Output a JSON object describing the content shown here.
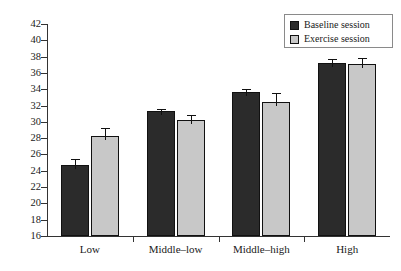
{
  "chart_data": {
    "type": "bar",
    "title": "",
    "xlabel": "",
    "ylabel": "Score (items correct)",
    "categories": [
      "Low",
      "Middle–low",
      "Middle–high",
      "High"
    ],
    "ylim": [
      16,
      42
    ],
    "ytick_step": 2,
    "yticks": [
      16,
      18,
      20,
      22,
      24,
      26,
      28,
      30,
      32,
      34,
      36,
      38,
      40,
      42
    ],
    "grid": false,
    "legend_position": "top-right",
    "error_bars": "standard error",
    "series": [
      {
        "name": "Baseline session",
        "color": "#2b2b2b",
        "values": [
          24.7,
          31.3,
          33.7,
          37.2
        ],
        "errors": [
          0.8,
          0.25,
          0.3,
          0.5
        ]
      },
      {
        "name": "Exercise session",
        "color": "#c8c8c8",
        "values": [
          28.3,
          30.2,
          32.4,
          37.1
        ],
        "errors": [
          1.0,
          0.7,
          1.1,
          0.7
        ]
      }
    ]
  },
  "legend": {
    "entries": [
      {
        "label": "Baseline session",
        "swatch": "dark"
      },
      {
        "label": "Exercise session",
        "swatch": "light"
      }
    ]
  }
}
